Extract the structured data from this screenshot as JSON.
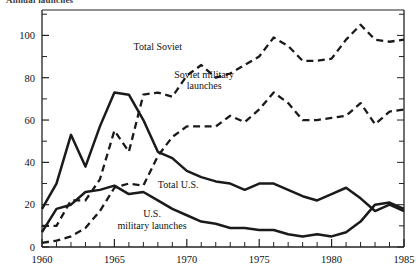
{
  "figure": {
    "title_clipped": "Annual launches",
    "title_note": "top of title cropped by image edge"
  },
  "axes": {
    "y_ticks_major": [
      0,
      20,
      40,
      60,
      80,
      100
    ],
    "y_ticks_minor": [
      10,
      30,
      50,
      70,
      90,
      110
    ],
    "x_ticks_major": [
      1960,
      1965,
      1970,
      1975,
      1980,
      1985
    ],
    "ylim": [
      0,
      112
    ],
    "xlim": [
      1960,
      1985
    ]
  },
  "annotations": [
    {
      "name": "total-soviet",
      "lines": [
        "Total Soviet"
      ],
      "x": 1968.0,
      "y": 93
    },
    {
      "name": "soviet-military",
      "lines": [
        "Soviet military",
        "launches"
      ],
      "x": 1971.2,
      "y": 80
    },
    {
      "name": "total-us",
      "lines": [
        "Total U.S."
      ],
      "x": 1969.4,
      "y": 28
    },
    {
      "name": "us-military",
      "lines": [
        "U.S.",
        "military launches"
      ],
      "x": 1967.6,
      "y": 14
    }
  ],
  "chart_data": {
    "type": "line",
    "title": "Annual launches",
    "xlabel": "",
    "ylabel": "",
    "xlim": [
      1960,
      1985
    ],
    "ylim": [
      0,
      112
    ],
    "grid": false,
    "legend": "inline-annotations",
    "x": [
      1960,
      1961,
      1962,
      1963,
      1964,
      1965,
      1966,
      1967,
      1968,
      1969,
      1970,
      1971,
      1972,
      1973,
      1974,
      1975,
      1976,
      1977,
      1978,
      1979,
      1980,
      1981,
      1982,
      1983,
      1984,
      1985
    ],
    "series": [
      {
        "name": "Total Soviet",
        "style": "dashed",
        "values": [
          10,
          10,
          22,
          22,
          32,
          55,
          45,
          72,
          73,
          71,
          81,
          86,
          80,
          82,
          86,
          90,
          99,
          95,
          88,
          88,
          89,
          98,
          105,
          98,
          97,
          98
        ]
      },
      {
        "name": "Soviet military launches",
        "style": "dashed",
        "values": [
          2,
          3,
          5,
          9,
          17,
          28,
          30,
          29,
          43,
          52,
          57,
          57,
          57,
          62,
          59,
          65,
          73,
          68,
          60,
          60,
          61,
          62,
          68,
          58,
          64,
          65
        ]
      },
      {
        "name": "Total U.S.",
        "style": "solid",
        "values": [
          18,
          30,
          53,
          38,
          57,
          73,
          72,
          60,
          45,
          42,
          36,
          33,
          31,
          30,
          27,
          30,
          30,
          27,
          24,
          22,
          25,
          28,
          23,
          17,
          20,
          17
        ]
      },
      {
        "name": "U.S. military launches",
        "style": "solid",
        "values": [
          7,
          18,
          20,
          26,
          27,
          29,
          25,
          26,
          22,
          18,
          15,
          12,
          11,
          9,
          9,
          8,
          8,
          6,
          5,
          6,
          5,
          7,
          12,
          20,
          21,
          18
        ]
      }
    ]
  }
}
